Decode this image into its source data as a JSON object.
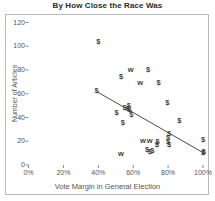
{
  "chart_data": {
    "type": "scatter",
    "title": "By How Close the Race Was",
    "xlabel": "Vote Margin in General Election",
    "ylabel": "Number of Articles",
    "xlim": [
      0,
      105
    ],
    "ylim": [
      0,
      125
    ],
    "grid": false,
    "legend": null,
    "x_ticks": [
      "0%",
      "20%",
      "40%",
      "60%",
      "80%",
      "100%"
    ],
    "x_tick_values": [
      0,
      20,
      40,
      60,
      80,
      100
    ],
    "y_ticks": [
      "0",
      "20",
      "40",
      "60",
      "80",
      "100",
      "120"
    ],
    "y_tick_values": [
      0,
      20,
      40,
      60,
      80,
      100,
      120
    ],
    "marker_labels": {
      "dollar": "$",
      "w": "w"
    },
    "points": [
      {
        "x": 40.0,
        "y": 104,
        "label": "$"
      },
      {
        "x": 53.0,
        "y": 74,
        "label": "$"
      },
      {
        "x": 58.5,
        "y": 80,
        "label": "w"
      },
      {
        "x": 68.5,
        "y": 80,
        "label": "$"
      },
      {
        "x": 64.0,
        "y": 69,
        "label": "w"
      },
      {
        "x": 74.5,
        "y": 69,
        "label": "$"
      },
      {
        "x": 39.0,
        "y": 62,
        "label": "$"
      },
      {
        "x": 79.5,
        "y": 52,
        "label": "$"
      },
      {
        "x": 57.5,
        "y": 50,
        "label": "$"
      },
      {
        "x": 55.0,
        "y": 48,
        "label": "$"
      },
      {
        "x": 57.0,
        "y": 47,
        "label": "$"
      },
      {
        "x": 58.0,
        "y": 46,
        "label": "$"
      },
      {
        "x": 50.5,
        "y": 44,
        "label": "$"
      },
      {
        "x": 59.0,
        "y": 42,
        "label": "$"
      },
      {
        "x": 86.5,
        "y": 37,
        "label": "$"
      },
      {
        "x": 54.0,
        "y": 35,
        "label": "$"
      },
      {
        "x": 80.5,
        "y": 26,
        "label": "$"
      },
      {
        "x": 80.0,
        "y": 23,
        "label": "$"
      },
      {
        "x": 100.0,
        "y": 21,
        "label": "$"
      },
      {
        "x": 65.5,
        "y": 20,
        "label": "w"
      },
      {
        "x": 69.5,
        "y": 20,
        "label": "w"
      },
      {
        "x": 74.0,
        "y": 19,
        "label": "$"
      },
      {
        "x": 80.0,
        "y": 19,
        "label": "$"
      },
      {
        "x": 80.5,
        "y": 17,
        "label": "$"
      },
      {
        "x": 73.5,
        "y": 17,
        "label": "$"
      },
      {
        "x": 68.0,
        "y": 13,
        "label": "$"
      },
      {
        "x": 71.0,
        "y": 12,
        "label": "$"
      },
      {
        "x": 69.5,
        "y": 11,
        "label": "$"
      },
      {
        "x": 100.5,
        "y": 11,
        "label": "$"
      },
      {
        "x": 100.0,
        "y": 10,
        "label": "$"
      },
      {
        "x": 53.0,
        "y": 9,
        "label": "w"
      }
    ],
    "trendline": {
      "x0": 39.5,
      "y0": 61.5,
      "x1": 100.5,
      "y1": 10.0
    }
  },
  "colors": {
    "marker": "#3f3f3f",
    "trendline": "#4a4a4a",
    "axis_text": "#555555",
    "title_text": "#2b2b2b",
    "frame": "#b9b9b9",
    "background": "#ffffff"
  }
}
